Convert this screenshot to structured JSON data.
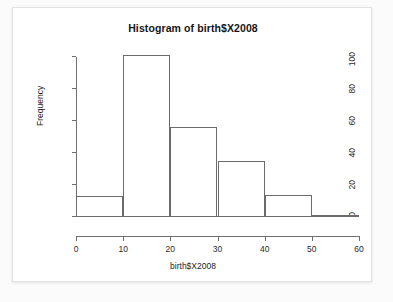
{
  "chart_data": {
    "type": "bar",
    "title": "Histogram of birth$X2008",
    "xlabel": "birth$X2008",
    "ylabel": "Frequency",
    "grid": false,
    "legend": null,
    "bin_width": 10,
    "bin_edges": [
      0,
      10,
      20,
      30,
      40,
      50,
      60
    ],
    "categories": [
      "0-10",
      "10-20",
      "20-30",
      "30-40",
      "40-50",
      "50-60"
    ],
    "values": [
      13,
      101,
      56,
      35,
      14,
      1
    ],
    "bins": [
      {
        "range": "0-10",
        "left": 0,
        "right": 10,
        "frequency": 13
      },
      {
        "range": "10-20",
        "left": 10,
        "right": 20,
        "frequency": 101
      },
      {
        "range": "20-30",
        "left": 20,
        "right": 30,
        "frequency": 56
      },
      {
        "range": "30-40",
        "left": 30,
        "right": 40,
        "frequency": 35
      },
      {
        "range": "40-50",
        "left": 40,
        "right": 50,
        "frequency": 14
      },
      {
        "range": "50-60",
        "left": 50,
        "right": 60,
        "frequency": 1
      }
    ],
    "xlim": [
      0,
      60
    ],
    "ylim": [
      0,
      100
    ],
    "xticks": [
      0,
      10,
      20,
      30,
      40,
      50,
      60
    ],
    "yticks": [
      0,
      20,
      40,
      60,
      80,
      100
    ],
    "xtick_labels": [
      "0",
      "10",
      "20",
      "30",
      "40",
      "50",
      "60"
    ],
    "ytick_labels": [
      "0",
      "20",
      "40",
      "60",
      "80",
      "100"
    ],
    "colors": {
      "bar_outline": "#6b6b6b",
      "bar_fill": "transparent",
      "axis": "#6f6f6f",
      "text": "#1d1d1d",
      "card_background": "#ffffff",
      "page_background": "#fbfbfb"
    }
  }
}
